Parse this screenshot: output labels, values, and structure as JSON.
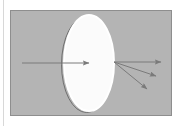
{
  "figure": {
    "canvas": {
      "width": 182,
      "height": 126,
      "background_color": "#ffffff"
    },
    "left_margin_rule": {
      "name": "left-margin-rule",
      "x": 3.5,
      "y1": 0,
      "y2": 126,
      "color": "#d8d8d8",
      "width": 1
    },
    "panel": {
      "name": "gray-panel",
      "x": 10,
      "y": 10,
      "width": 162,
      "height": 106,
      "fill_color": "#b4b4b4",
      "border_color": "#8e8e8e",
      "border_width": 1
    },
    "lens": {
      "name": "lens-ellipse",
      "center_x": 89,
      "center_y": 63,
      "radius_x": 25,
      "radius_y": 48,
      "fill_color": "#fbfbfb",
      "stroke_color": "#ffffff",
      "stroke_width": 2,
      "shadow_stroke_color": "#6f6f6f",
      "shadow_offset_x": -2.5,
      "shadow_offset_y": 1.5,
      "shadow_stroke_width": 1
    },
    "rays": {
      "stroke_color": "#7a7a7a",
      "stroke_width": 1,
      "arrow_fill_color": "#7a7a7a",
      "incoming": {
        "name": "incoming-ray-arrow",
        "label": "Incoming ray",
        "x1": 22,
        "y1": 63,
        "x2": 89,
        "y2": 63
      },
      "outgoing": [
        {
          "name": "outgoing-ray-arrow-1",
          "label": "Outgoing ray 1",
          "x1": 114,
          "y1": 62,
          "x2": 161,
          "y2": 62
        },
        {
          "name": "outgoing-ray-arrow-2",
          "label": "Outgoing ray 2",
          "x1": 114,
          "y1": 62,
          "x2": 156,
          "y2": 76
        },
        {
          "name": "outgoing-ray-arrow-3",
          "label": "Outgoing ray 3",
          "x1": 114,
          "y1": 62,
          "x2": 147,
          "y2": 89
        }
      ]
    }
  }
}
